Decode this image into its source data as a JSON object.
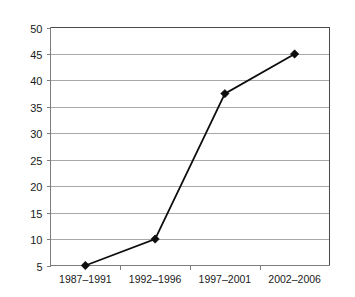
{
  "chart_data": {
    "type": "line",
    "title": "",
    "subtitle": "",
    "xlabel": "",
    "ylabel": "",
    "categories": [
      "1987–1991",
      "1992–1996",
      "1997–2001",
      "2002–2006"
    ],
    "values": [
      5,
      10,
      37.5,
      45
    ],
    "series": [
      {
        "name": "",
        "values": [
          5,
          10,
          37.5,
          45
        ]
      }
    ],
    "ylim": [
      5,
      50
    ],
    "ytick_step": 5,
    "ytick_labels": [
      "5",
      "10",
      "15",
      "20",
      "25",
      "30",
      "35",
      "40",
      "45",
      "50"
    ],
    "ytick_values": [
      5,
      10,
      15,
      20,
      25,
      30,
      35,
      40,
      45,
      50
    ],
    "grid": "horizontal",
    "legend": "none",
    "marker": "diamond",
    "annotations": [],
    "colors": {
      "line": "#0d0d0d",
      "marker": "#0d0d0d",
      "gridline": "#a8a8a8",
      "axis": "#7d7d7d",
      "frame": "#4a4a4a",
      "background": "#ffffff",
      "text": "#1a1a1a"
    }
  }
}
